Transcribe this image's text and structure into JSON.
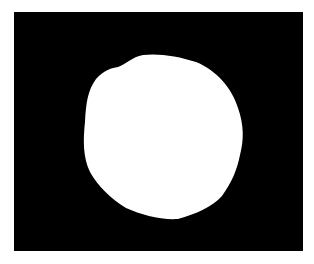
{
  "image": {
    "kind": "binary-segmentation-mask",
    "background_color": "#000000",
    "border_color": "#ffffff",
    "foreground_color": "#ffffff",
    "object": {
      "shape": "irregular-round-blob",
      "bbox": {
        "x": 84,
        "y": 54,
        "width": 160,
        "height": 165
      }
    }
  }
}
